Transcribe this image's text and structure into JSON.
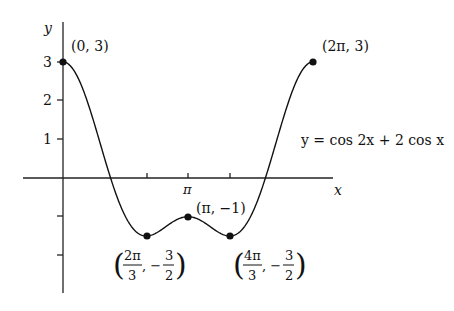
{
  "chart_data": {
    "type": "line",
    "title": "",
    "equation": "y = cos 2x + 2 cos x",
    "xlabel": "x",
    "ylabel": "y",
    "xlim": [
      0,
      6.2832
    ],
    "ylim": [
      -3,
      3
    ],
    "x_ticks": [
      {
        "value": 2.0944,
        "label": ""
      },
      {
        "value": 3.1416,
        "label": "π"
      },
      {
        "value": 4.1888,
        "label": ""
      }
    ],
    "y_ticks": [
      {
        "value": 3,
        "label": "3"
      },
      {
        "value": 2,
        "label": "2"
      },
      {
        "value": 1,
        "label": "1"
      },
      {
        "value": -1,
        "label": ""
      },
      {
        "value": -2,
        "label": ""
      }
    ],
    "grid": false,
    "series": [
      {
        "name": "y = cos 2x + 2 cos x",
        "function": "cos(2x) + 2cos(x)",
        "domain": [
          0,
          6.2832
        ]
      }
    ],
    "marked_points": [
      {
        "x": 0,
        "y": 3,
        "label": "(0,3)"
      },
      {
        "x": 6.2832,
        "y": 3,
        "label": "(2π,3)"
      },
      {
        "x": 3.1416,
        "y": -1,
        "label": "(π,−1)"
      },
      {
        "x": 2.0944,
        "y": -1.5,
        "label": "(2π/3, −3/2)"
      },
      {
        "x": 4.1888,
        "y": -1.5,
        "label": "(4π/3, −3/2)"
      }
    ]
  },
  "labels": {
    "y_axis": "y",
    "x_axis": "x",
    "tick_3": "3",
    "tick_2": "2",
    "tick_1": "1",
    "tick_pi": "π",
    "equation": "y = cos 2x + 2 cos x",
    "pt_origin": "(0, 3)",
    "pt_2pi": "(2π, 3)",
    "pt_pi": "(π, −1)",
    "min1_num": "2π",
    "min1_den": "3",
    "min2_num": "4π",
    "min2_den": "3",
    "frac_y_num": "3",
    "frac_y_den": "2",
    "comma_minus": ", −"
  }
}
